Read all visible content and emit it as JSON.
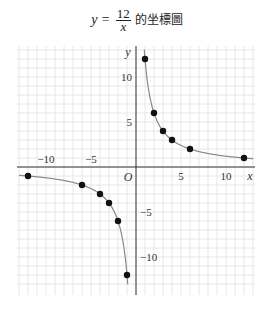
{
  "title": {
    "prefix": "y = ",
    "numerator": "12",
    "denominator": "x",
    "suffix": "的坐標圖"
  },
  "chart_data": {
    "type": "scatter",
    "xlabel": "x",
    "ylabel": "y",
    "origin_label": "O",
    "xlim": [
      -13,
      13
    ],
    "ylim": [
      -13,
      13
    ],
    "grid": true,
    "x_ticks": [
      -10,
      -5,
      5,
      10
    ],
    "y_ticks": [
      -10,
      -5,
      5,
      10
    ],
    "x_tick_labels": [
      "−10",
      "−5",
      "5",
      "10"
    ],
    "y_tick_labels": [
      "−10",
      "−5",
      "5",
      "10"
    ],
    "curve": "y = 12/x",
    "series": [
      {
        "name": "y = 12/x (x > 0)",
        "points": [
          [
            1,
            12
          ],
          [
            2,
            6
          ],
          [
            3,
            4
          ],
          [
            4,
            3
          ],
          [
            6,
            2
          ],
          [
            12,
            1
          ]
        ]
      },
      {
        "name": "y = 12/x (x < 0)",
        "points": [
          [
            -12,
            -1
          ],
          [
            -6,
            -2
          ],
          [
            -4,
            -3
          ],
          [
            -3,
            -4
          ],
          [
            -2,
            -6
          ],
          [
            -1,
            -12
          ]
        ]
      }
    ],
    "colors": {
      "curve": "#888888",
      "points": "#111111",
      "grid": "#e6e6e6",
      "axes": "#333333"
    }
  }
}
